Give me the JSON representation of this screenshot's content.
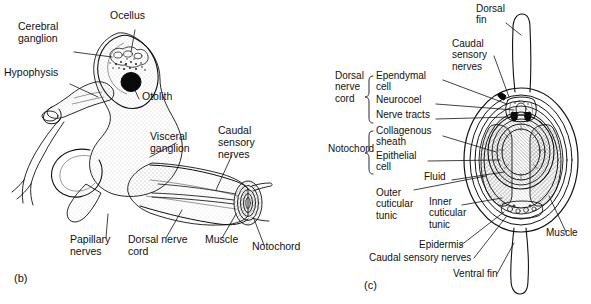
{
  "figure": {
    "background": "#ffffff",
    "ink_color": "#111111"
  },
  "panels": [
    {
      "id": "b",
      "id_label": "(b)",
      "caption": "Whole ascidian tadpole larva, lateral view",
      "labels": [
        {
          "key": "cerebral-ganglion",
          "text": "Cerebral\nganglion",
          "lines": [
            "Cerebral",
            "ganglion"
          ],
          "x": 18,
          "y": 30,
          "anchor": "start"
        },
        {
          "key": "ocellus",
          "text": "Ocellus",
          "lines": [
            "Ocellus"
          ],
          "x": 110,
          "y": 19,
          "anchor": "start"
        },
        {
          "key": "hypophysis",
          "text": "Hypophysis",
          "lines": [
            "Hypophysis"
          ],
          "x": 4,
          "y": 76,
          "anchor": "start"
        },
        {
          "key": "otolith",
          "text": "Otolith",
          "lines": [
            "Otolith"
          ],
          "x": 142,
          "y": 100,
          "anchor": "start"
        },
        {
          "key": "visceral-ganglion",
          "text": "Visceral\nganglion",
          "lines": [
            "Visceral",
            "ganglion"
          ],
          "x": 150,
          "y": 140,
          "anchor": "start"
        },
        {
          "key": "caudal-sensory-nerves",
          "text": "Caudal\nsensory\nnerves",
          "lines": [
            "Caudal",
            "sensory",
            "nerves"
          ],
          "x": 218,
          "y": 134,
          "anchor": "start"
        },
        {
          "key": "papillary-nerves",
          "text": "Papillary\nnerves",
          "lines": [
            "Papillary",
            "nerves"
          ],
          "x": 70,
          "y": 243,
          "anchor": "start"
        },
        {
          "key": "dorsal-nerve-cord",
          "text": "Dorsal nerve\ncord",
          "lines": [
            "Dorsal nerve",
            "cord"
          ],
          "x": 128,
          "y": 243,
          "anchor": "start"
        },
        {
          "key": "muscle",
          "text": "Muscle",
          "lines": [
            "Muscle"
          ],
          "x": 205,
          "y": 243,
          "anchor": "start"
        },
        {
          "key": "notochord",
          "text": "Notochord",
          "lines": [
            "Notochord"
          ],
          "x": 252,
          "y": 250,
          "anchor": "start"
        }
      ]
    },
    {
      "id": "c",
      "id_label": "(c)",
      "caption": "Transverse section through the larval tail",
      "group_braces": [
        {
          "key": "dorsal-nerve-cord-group",
          "text": "Dorsal\nnerve\ncord",
          "lines": [
            "Dorsal",
            "nerve",
            "cord"
          ],
          "members": [
            "Ependymal cell",
            "Neurocoel",
            "Nerve tracts"
          ]
        },
        {
          "key": "notochord-group",
          "text": "Notochord",
          "lines": [
            "Notochord"
          ],
          "members": [
            "Collagenous sheath",
            "Epithelial cell"
          ]
        }
      ],
      "labels": [
        {
          "key": "dorsal-fin",
          "text": "Dorsal\nfin",
          "lines": [
            "Dorsal",
            "fin"
          ],
          "x": 476,
          "y": 12,
          "anchor": "start"
        },
        {
          "key": "caudal-sensory-nerves-c",
          "text": "Caudal\nsensory\nnerves",
          "lines": [
            "Caudal",
            "sensory",
            "nerves"
          ],
          "x": 452,
          "y": 47,
          "anchor": "start"
        },
        {
          "key": "dorsal-nerve-cord-c",
          "text": "Dorsal\nnerve\ncord",
          "lines": [
            "Dorsal",
            "nerve",
            "cord"
          ],
          "x": 335,
          "y": 79,
          "anchor": "start"
        },
        {
          "key": "ependymal-cell",
          "text": "Ependymal\ncell",
          "lines": [
            "Ependymal",
            "cell"
          ],
          "x": 376,
          "y": 79,
          "anchor": "start"
        },
        {
          "key": "neurocoel",
          "text": "Neurocoel",
          "lines": [
            "Neurocoel"
          ],
          "x": 376,
          "y": 103,
          "anchor": "start"
        },
        {
          "key": "nerve-tracts",
          "text": "Nerve tracts",
          "lines": [
            "Nerve tracts"
          ],
          "x": 376,
          "y": 118,
          "anchor": "start"
        },
        {
          "key": "collagenous-sheath",
          "text": "Collagenous\nsheath",
          "lines": [
            "Collagenous",
            "sheath"
          ],
          "x": 376,
          "y": 134,
          "anchor": "start"
        },
        {
          "key": "notochord-c",
          "text": "Notochord",
          "lines": [
            "Notochord"
          ],
          "x": 328,
          "y": 152,
          "anchor": "start"
        },
        {
          "key": "epithelial-cell",
          "text": "Epithelial\ncell",
          "lines": [
            "Epithelial",
            "cell"
          ],
          "x": 376,
          "y": 159,
          "anchor": "start"
        },
        {
          "key": "fluid",
          "text": "Fluid",
          "lines": [
            "Fluid"
          ],
          "x": 424,
          "y": 180,
          "anchor": "start"
        },
        {
          "key": "outer-cuticular-tunic",
          "text": "Outer\ncuticular\ntunic",
          "lines": [
            "Outer",
            "cuticular",
            "tunic"
          ],
          "x": 376,
          "y": 196,
          "anchor": "start"
        },
        {
          "key": "inner-cuticular-tunic",
          "text": "Inner\ncuticular\ntunic",
          "lines": [
            "Inner",
            "cuticular",
            "tunic"
          ],
          "x": 429,
          "y": 205,
          "anchor": "start"
        },
        {
          "key": "epidermis",
          "text": "Epidermis",
          "lines": [
            "Epidermis"
          ],
          "x": 419,
          "y": 248,
          "anchor": "start"
        },
        {
          "key": "caudal-sensory-nerves-bottom",
          "text": "Caudal sensory nerves",
          "lines": [
            "Caudal sensory nerves"
          ],
          "x": 369,
          "y": 261,
          "anchor": "start"
        },
        {
          "key": "ventral-fin",
          "text": "Ventral fin",
          "lines": [
            "Ventral fin"
          ],
          "x": 453,
          "y": 277,
          "anchor": "start"
        },
        {
          "key": "muscle-c",
          "text": "Muscle",
          "lines": [
            "Muscle"
          ],
          "x": 546,
          "y": 236,
          "anchor": "start"
        }
      ]
    }
  ]
}
